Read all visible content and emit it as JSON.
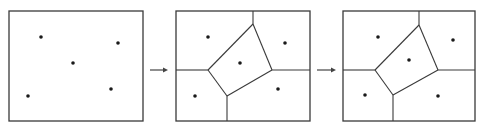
{
  "diagram": {
    "title": "",
    "colors": {
      "line": "#3a3a3a",
      "point": "#1a1a1a",
      "background": "#ffffff"
    },
    "panels": [
      {
        "id": "panel-1",
        "label": "",
        "frame": {
          "x": 9,
          "y": 11,
          "w": 134,
          "h": 110
        },
        "sites": [
          [
            41,
            37
          ],
          [
            118,
            43
          ],
          [
            73,
            63
          ],
          [
            28,
            96
          ],
          [
            111,
            89
          ]
        ],
        "edges": []
      },
      {
        "id": "panel-2",
        "label": "",
        "frame": {
          "x": 176,
          "y": 11,
          "w": 134,
          "h": 110
        },
        "sites": [
          [
            208,
            37
          ],
          [
            285,
            43
          ],
          [
            240,
            63
          ],
          [
            195,
            96
          ],
          [
            278,
            89
          ]
        ],
        "edges": [
          [
            [
              253,
              11
            ],
            [
              253,
              24
            ]
          ],
          [
            [
              253,
              24
            ],
            [
              272,
              70
            ]
          ],
          [
            [
              272,
              70
            ],
            [
              227,
              96
            ]
          ],
          [
            [
              227,
              96
            ],
            [
              208,
              70
            ]
          ],
          [
            [
              208,
              70
            ],
            [
              253,
              24
            ]
          ],
          [
            [
              176,
              70
            ],
            [
              208,
              70
            ]
          ],
          [
            [
              272,
              70
            ],
            [
              310,
              70
            ]
          ],
          [
            [
              227,
              96
            ],
            [
              227,
              121
            ]
          ]
        ]
      },
      {
        "id": "panel-3",
        "label": "",
        "frame": {
          "x": 343,
          "y": 11,
          "w": 132,
          "h": 110
        },
        "sites": [
          [
            378,
            37
          ],
          [
            453,
            40
          ],
          [
            409,
            60
          ],
          [
            365,
            95
          ],
          [
            438,
            96
          ]
        ],
        "edges": [
          [
            [
              419,
              11
            ],
            [
              419,
              25
            ]
          ],
          [
            [
              419,
              25
            ],
            [
              438,
              70
            ]
          ],
          [
            [
              438,
              70
            ],
            [
              393,
              95
            ]
          ],
          [
            [
              393,
              95
            ],
            [
              375,
              70
            ]
          ],
          [
            [
              375,
              70
            ],
            [
              419,
              25
            ]
          ],
          [
            [
              343,
              70
            ],
            [
              375,
              70
            ]
          ],
          [
            [
              438,
              70
            ],
            [
              475,
              70
            ]
          ],
          [
            [
              393,
              95
            ],
            [
              393,
              121
            ]
          ]
        ]
      }
    ],
    "arrows": [
      {
        "id": "arrow-1",
        "from": [
          150,
          70
        ],
        "to": [
          168,
          70
        ]
      },
      {
        "id": "arrow-2",
        "from": [
          317,
          70
        ],
        "to": [
          336,
          70
        ]
      }
    ]
  }
}
